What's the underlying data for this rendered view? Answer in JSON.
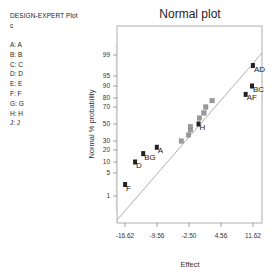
{
  "sidebar": {
    "title": "DESIGN-EXPERT Plot",
    "subtitle": "c",
    "factors": [
      "A: A",
      "B: B",
      "C: C",
      "D: D",
      "E: E",
      "F: F",
      "G: G",
      "H: H",
      "J: J"
    ]
  },
  "chart_data": {
    "type": "scatter",
    "title": "Normal plot",
    "xlabel": "Effect",
    "ylabel": "Normal % probability",
    "x_ticks": [
      "-16.62",
      "-9.56",
      "-2.50",
      "4.56",
      "11.62"
    ],
    "y_ticks": [
      "1",
      "5",
      "10",
      "20",
      "30",
      "50",
      "70",
      "80",
      "90",
      "95",
      "99"
    ],
    "xlim": [
      -18.5,
      12.5
    ],
    "grid": false,
    "reference_line": {
      "from": [
        -18.5,
        0.3
      ],
      "to": [
        12.5,
        99.3
      ]
    },
    "labeled_points": [
      {
        "label": "F",
        "effect": -16.6,
        "prob": 3
      },
      {
        "label": "D",
        "effect": -14.4,
        "prob": 10
      },
      {
        "label": "BG",
        "effect": -12.6,
        "prob": 17
      },
      {
        "label": "A",
        "effect": -9.6,
        "prob": 23
      },
      {
        "label": "H",
        "effect": -0.4,
        "prob": 50
      },
      {
        "label": "AF",
        "effect": 10.0,
        "prob": 83
      },
      {
        "label": "BC",
        "effect": 11.4,
        "prob": 90
      },
      {
        "label": "AD",
        "effect": 11.6,
        "prob": 97
      }
    ],
    "unlabeled_points": [
      {
        "effect": -4.2,
        "prob": 30
      },
      {
        "effect": -2.6,
        "prob": 37
      },
      {
        "effect": -2.2,
        "prob": 43
      },
      {
        "effect": -2.2,
        "prob": 47
      },
      {
        "effect": -0.2,
        "prob": 57
      },
      {
        "effect": 0.8,
        "prob": 63
      },
      {
        "effect": 1.2,
        "prob": 70
      },
      {
        "effect": 2.6,
        "prob": 77
      }
    ]
  }
}
